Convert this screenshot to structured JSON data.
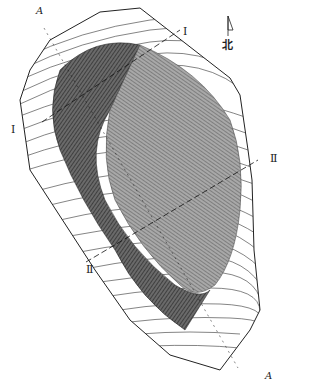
{
  "map": {
    "type": "topographic contour map",
    "north_label": "北",
    "section_labels": {
      "a_top": "A",
      "a_bottom": "A",
      "i_top": "Ⅰ",
      "i_left": "Ⅰ",
      "ii_right": "Ⅱ",
      "ii_left": "Ⅱ"
    },
    "colors": {
      "background": "#ffffff",
      "contour": "#333333",
      "pit_dark": "#555555",
      "pit_mid": "#8a8a8a",
      "boundary": "#222222"
    }
  }
}
